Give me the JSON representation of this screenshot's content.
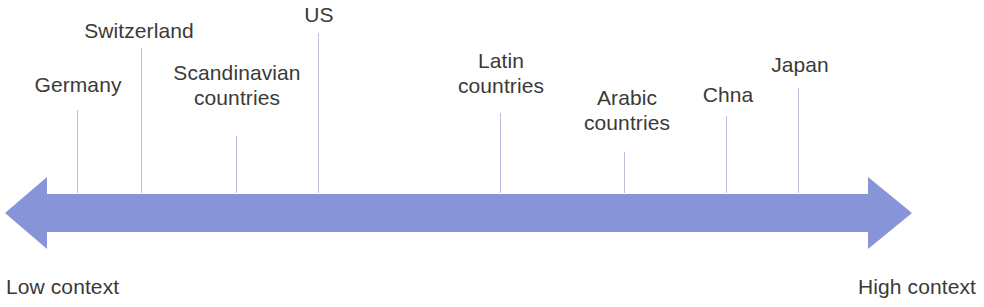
{
  "diagram": {
    "type": "continuum-scale",
    "axis": {
      "arrow_color": "#8894d8",
      "leader_line_color": "#b9c0dd",
      "left_endpoint_label": "Low context",
      "right_endpoint_label": "High context",
      "direction": "bidirectional"
    },
    "markers": [
      {
        "id": "germany",
        "label": "Germany",
        "position_x": 77,
        "label_left": 24,
        "label_top": 72,
        "label_width": 108,
        "line_top": 110,
        "line_height": 83
      },
      {
        "id": "switzerland",
        "label": "Switzerland",
        "position_x": 141,
        "label_left": 66,
        "label_top": 18,
        "label_width": 146,
        "line_top": 48,
        "line_height": 145
      },
      {
        "id": "scandinavian",
        "label": "Scandinavian\ncountries",
        "position_x": 236,
        "label_left": 144,
        "label_top": 60,
        "label_width": 186,
        "line_top": 136,
        "line_height": 57
      },
      {
        "id": "us",
        "label": "US",
        "position_x": 318,
        "label_left": 290,
        "label_top": 2,
        "label_width": 58,
        "line_top": 33,
        "line_height": 160
      },
      {
        "id": "latin",
        "label": "Latin\ncountries",
        "position_x": 500,
        "label_left": 442,
        "label_top": 48,
        "label_width": 118,
        "line_top": 113,
        "line_height": 80
      },
      {
        "id": "arabic",
        "label": "Arabic\ncountries",
        "position_x": 624,
        "label_left": 566,
        "label_top": 85,
        "label_width": 122,
        "line_top": 152,
        "line_height": 41
      },
      {
        "id": "china",
        "label": "Chna",
        "position_x": 726,
        "label_left": 688,
        "label_top": 82,
        "label_width": 80,
        "line_top": 116,
        "line_height": 77
      },
      {
        "id": "japan",
        "label": "Japan",
        "position_x": 798,
        "label_left": 758,
        "label_top": 52,
        "label_width": 84,
        "line_top": 88,
        "line_height": 105
      }
    ]
  },
  "chart_data": {
    "type": "scatter",
    "title": "",
    "xlabel": "",
    "ylabel": "",
    "axis_low_label": "Low context",
    "axis_high_label": "High context",
    "categories": [
      "Germany",
      "Switzerland",
      "Scandinavian countries",
      "US",
      "Latin countries",
      "Arabic countries",
      "Chna",
      "Japan"
    ],
    "x": [
      77,
      141,
      236,
      318,
      500,
      624,
      726,
      798
    ],
    "values": [
      0.079,
      0.15,
      0.255,
      0.345,
      0.546,
      0.683,
      0.796,
      0.876
    ],
    "xlim": [
      0,
      1
    ],
    "grid": false,
    "legend": "none"
  }
}
